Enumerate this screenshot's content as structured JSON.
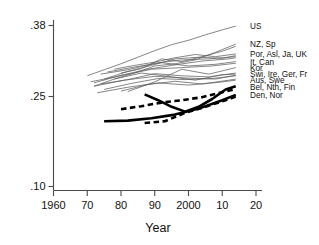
{
  "chart_data": {
    "type": "line",
    "title": "",
    "xlabel": "Year",
    "ylabel": "",
    "xlim": [
      1960,
      2020
    ],
    "ylim": [
      0.1,
      0.38
    ],
    "grid": false,
    "legend_position": "right-edge-labels",
    "xticks": [
      1960,
      1970,
      1980,
      1990,
      2000,
      2010,
      2020
    ],
    "xtick_labels": [
      "1960",
      "70",
      "80",
      "90",
      "2000",
      "10",
      "20"
    ],
    "yticks": [
      0.1,
      0.25,
      0.38
    ],
    "ytick_labels": [
      ".10",
      ".25",
      ".38"
    ],
    "annotations": [
      "US",
      "NZ, Sp",
      "Por, Asl, Ja, UK",
      "It, Can",
      "Kor",
      "Swi, Ire, Ger, Fr",
      "Aus, Swe",
      "Bel, Nth, Fin",
      "Den, Nor"
    ],
    "series": [
      {
        "name": "US",
        "style": "thin",
        "x": [
          1970,
          1975,
          1980,
          1985,
          1990,
          1995,
          2000,
          2005,
          2010,
          2014
        ],
        "values": [
          0.287,
          0.298,
          0.309,
          0.321,
          0.333,
          0.344,
          0.352,
          0.362,
          0.371,
          0.378
        ]
      },
      {
        "name": "NZ",
        "style": "thin",
        "x": [
          1972,
          1978,
          1984,
          1990,
          1996,
          2002,
          2008,
          2014
        ],
        "values": [
          0.268,
          0.281,
          0.292,
          0.305,
          0.309,
          0.316,
          0.33,
          0.345
        ]
      },
      {
        "name": "Sp",
        "style": "thin",
        "x": [
          1980,
          1986,
          1992,
          1998,
          2004,
          2010,
          2014
        ],
        "values": [
          0.292,
          0.3,
          0.318,
          0.313,
          0.322,
          0.332,
          0.341
        ]
      },
      {
        "name": "Por",
        "style": "thin",
        "x": [
          1978,
          1984,
          1990,
          1996,
          2002,
          2008,
          2014
        ],
        "values": [
          0.299,
          0.306,
          0.312,
          0.32,
          0.326,
          0.322,
          0.327
        ]
      },
      {
        "name": "Asl",
        "style": "thin",
        "x": [
          1975,
          1982,
          1989,
          1996,
          2003,
          2010,
          2014
        ],
        "values": [
          0.281,
          0.295,
          0.306,
          0.318,
          0.321,
          0.319,
          0.324
        ]
      },
      {
        "name": "Ja",
        "style": "thin",
        "x": [
          1974,
          1982,
          1990,
          1998,
          2006,
          2014
        ],
        "values": [
          0.29,
          0.298,
          0.31,
          0.316,
          0.318,
          0.322
        ]
      },
      {
        "name": "UK",
        "style": "thin",
        "x": [
          1972,
          1980,
          1988,
          1996,
          2004,
          2012,
          2014
        ],
        "values": [
          0.274,
          0.288,
          0.299,
          0.307,
          0.314,
          0.318,
          0.32
        ]
      },
      {
        "name": "It",
        "style": "thin",
        "x": [
          1976,
          1984,
          1992,
          2000,
          2008,
          2014
        ],
        "values": [
          0.294,
          0.303,
          0.311,
          0.305,
          0.308,
          0.313
        ]
      },
      {
        "name": "Can",
        "style": "thin",
        "x": [
          1971,
          1980,
          1989,
          1998,
          2007,
          2014
        ],
        "values": [
          0.276,
          0.287,
          0.299,
          0.302,
          0.305,
          0.31
        ]
      },
      {
        "name": "Kor",
        "style": "thin",
        "x": [
          1982,
          1990,
          1998,
          2006,
          2014
        ],
        "values": [
          0.258,
          0.276,
          0.299,
          0.29,
          0.302
        ]
      },
      {
        "name": "Swi",
        "style": "thin",
        "x": [
          1974,
          1982,
          1990,
          1998,
          2006,
          2014
        ],
        "values": [
          0.272,
          0.28,
          0.291,
          0.287,
          0.285,
          0.292
        ]
      },
      {
        "name": "Ire",
        "style": "thin",
        "x": [
          1978,
          1986,
          1994,
          2002,
          2010,
          2014
        ],
        "values": [
          0.281,
          0.292,
          0.286,
          0.279,
          0.289,
          0.29
        ]
      },
      {
        "name": "Ger",
        "style": "thin",
        "x": [
          1972,
          1981,
          1990,
          1999,
          2008,
          2014
        ],
        "values": [
          0.268,
          0.279,
          0.286,
          0.283,
          0.281,
          0.288
        ]
      },
      {
        "name": "Fr",
        "style": "thin",
        "x": [
          1975,
          1983,
          1991,
          1999,
          2007,
          2014
        ],
        "values": [
          0.262,
          0.273,
          0.282,
          0.28,
          0.282,
          0.287
        ]
      },
      {
        "name": "Aus",
        "style": "thin",
        "x": [
          1980,
          1988,
          1996,
          2004,
          2012,
          2014
        ],
        "values": [
          0.259,
          0.271,
          0.277,
          0.272,
          0.279,
          0.281
        ]
      },
      {
        "name": "Swe",
        "style": "thin",
        "x": [
          1973,
          1982,
          1991,
          2000,
          2009,
          2014
        ],
        "values": [
          0.256,
          0.266,
          0.274,
          0.27,
          0.275,
          0.279
        ]
      },
      {
        "name": "Bel",
        "style": "thick",
        "x": [
          1987,
          1991,
          1995,
          1999,
          2003,
          2007,
          2011,
          2014
        ],
        "values": [
          0.253,
          0.243,
          0.232,
          0.224,
          0.232,
          0.245,
          0.262,
          0.268
        ]
      },
      {
        "name": "Nth",
        "style": "dash",
        "x": [
          1980,
          1986,
          1992,
          1998,
          2004,
          2010,
          2014
        ],
        "values": [
          0.228,
          0.233,
          0.239,
          0.243,
          0.248,
          0.257,
          0.263
        ]
      },
      {
        "name": "Fin",
        "style": "thick",
        "x": [
          1975,
          1982,
          1989,
          1996,
          2003,
          2010,
          2014
        ],
        "values": [
          0.208,
          0.209,
          0.213,
          0.219,
          0.229,
          0.243,
          0.252
        ]
      },
      {
        "name": "Den, Nor",
        "style": "dash",
        "x": [
          1987,
          1993,
          1999,
          2005,
          2011,
          2014
        ],
        "values": [
          0.205,
          0.208,
          0.222,
          0.232,
          0.243,
          0.249
        ]
      }
    ]
  },
  "axes": {
    "y": {
      "ticks": [
        {
          "label": ".38",
          "value": 0.38
        },
        {
          "label": ".25",
          "value": 0.25
        },
        {
          "label": ".10",
          "value": 0.1
        }
      ]
    },
    "x": {
      "title": "Year",
      "ticks": [
        {
          "label": "1960",
          "value": 1960
        },
        {
          "label": "70",
          "value": 1970
        },
        {
          "label": "80",
          "value": 1980
        },
        {
          "label": "90",
          "value": 1990
        },
        {
          "label": "2000",
          "value": 2000
        },
        {
          "label": "10",
          "value": 2010
        },
        {
          "label": "20",
          "value": 2020
        }
      ]
    }
  },
  "series_labels": [
    {
      "text": "US",
      "y": 0.378
    },
    {
      "text": "NZ, Sp",
      "y": 0.345
    },
    {
      "text": "Por, Asl, Ja, UK",
      "y": 0.327
    },
    {
      "text": "It, Can",
      "y": 0.313
    },
    {
      "text": "Kor",
      "y": 0.302
    },
    {
      "text": "Swi, Ire, Ger, Fr",
      "y": 0.29
    },
    {
      "text": "Aus, Swe",
      "y": 0.28
    },
    {
      "text": "Bel, Nth, Fin",
      "y": 0.267
    },
    {
      "text": "Den, Nor",
      "y": 0.252
    }
  ],
  "colors": {
    "thin_line": "#5d5d5d",
    "thick_line": "#000000",
    "axis": "#4a4a4a",
    "text": "#111111",
    "background": "#ffffff"
  }
}
